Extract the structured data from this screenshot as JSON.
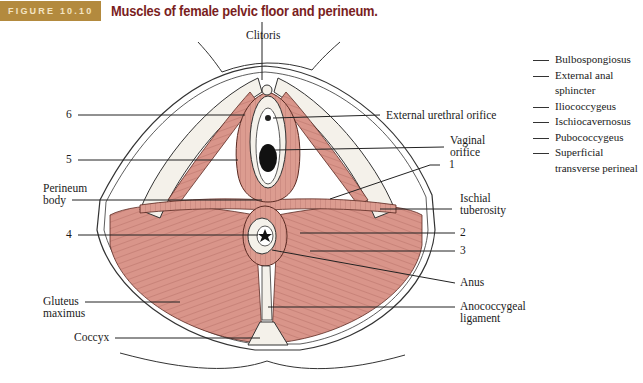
{
  "figure": {
    "number_label": "FIGURE 10.10",
    "title": "Muscles of female pelvic floor and perineum.",
    "badge_color": "#b38a3e",
    "title_color": "#7a1e1e",
    "muscle_color": "#d9958a"
  },
  "labels": {
    "clitoris": "Clitoris",
    "six": "6",
    "external_urethral_orifice": "External urethral orifice",
    "vaginal_orifice_1": "Vaginal",
    "vaginal_orifice_2": "orifice",
    "five": "5",
    "one": "1",
    "perineum_body_1": "Perineum",
    "perineum_body_2": "body",
    "ischial_tuberosity_1": "Ischial",
    "ischial_tuberosity_2": "tuberosity",
    "four": "4",
    "two": "2",
    "three": "3",
    "anus": "Anus",
    "gluteus_maximus_1": "Gluteus",
    "gluteus_maximus_2": "maximus",
    "anococcygeal_ligament_1": "Anococcygeal",
    "anococcygeal_ligament_2": "ligament",
    "coccyx": "Coccyx"
  },
  "legend": {
    "items": [
      "Bulbospongiosus",
      "External anal\nsphincter",
      "Iliococcygeus",
      "Ischiocavernosus",
      "Pubococcygeus",
      "Superficial\ntransverse perineal"
    ]
  }
}
